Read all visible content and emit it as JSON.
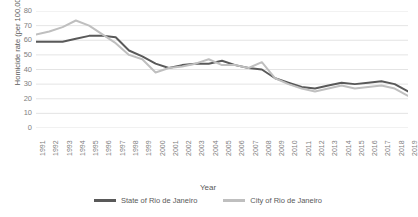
{
  "chart_data": {
    "type": "line",
    "title": "",
    "xlabel": "Year",
    "ylabel": "Homicide rate (per 100,000)",
    "ylim": [
      0,
      80
    ],
    "ytick_step": 10,
    "grid": true,
    "legend_position": "bottom",
    "categories": [
      1991,
      1992,
      1993,
      1994,
      1995,
      1996,
      1997,
      1998,
      1999,
      2000,
      2001,
      2002,
      2003,
      2004,
      2005,
      2006,
      2007,
      2008,
      2009,
      2010,
      2011,
      2012,
      2013,
      2014,
      2015,
      2016,
      2017,
      2018,
      2019
    ],
    "yticks": [
      "0",
      "10",
      "20",
      "30",
      "40",
      "50",
      "60",
      "70",
      "80"
    ],
    "xticks": [
      "1991",
      "1992",
      "1993",
      "1994",
      "1995",
      "1996",
      "1997",
      "1998",
      "1999",
      "2000",
      "2001",
      "2002",
      "2003",
      "2004",
      "2005",
      "2006",
      "2007",
      "2008",
      "2009",
      "2010",
      "2011",
      "2012",
      "2013",
      "2014",
      "2015",
      "2016",
      "2017",
      "2018",
      "2019"
    ],
    "series": [
      {
        "name": "State of Rio de Janeiro",
        "color": "#595959",
        "values": [
          59,
          59,
          59,
          61,
          63,
          63,
          62,
          53,
          49,
          44,
          41,
          43,
          44,
          44,
          46,
          43,
          41,
          40,
          34,
          31,
          28,
          27,
          29,
          31,
          30,
          31,
          32,
          30,
          25
        ]
      },
      {
        "name": "City of Rio de Janeiro",
        "color": "#bfbfbf",
        "values": [
          64,
          66,
          69,
          73.5,
          70,
          64,
          58,
          50,
          47,
          38,
          41,
          42,
          44,
          47,
          43,
          43,
          41,
          45,
          34,
          30,
          27,
          25,
          27,
          29,
          27,
          28,
          29,
          27,
          22
        ]
      }
    ]
  },
  "legend": {
    "items": [
      {
        "label": "State of Rio de Janeiro",
        "color": "#595959"
      },
      {
        "label": "City of Rio de Janeiro",
        "color": "#bfbfbf"
      }
    ]
  }
}
